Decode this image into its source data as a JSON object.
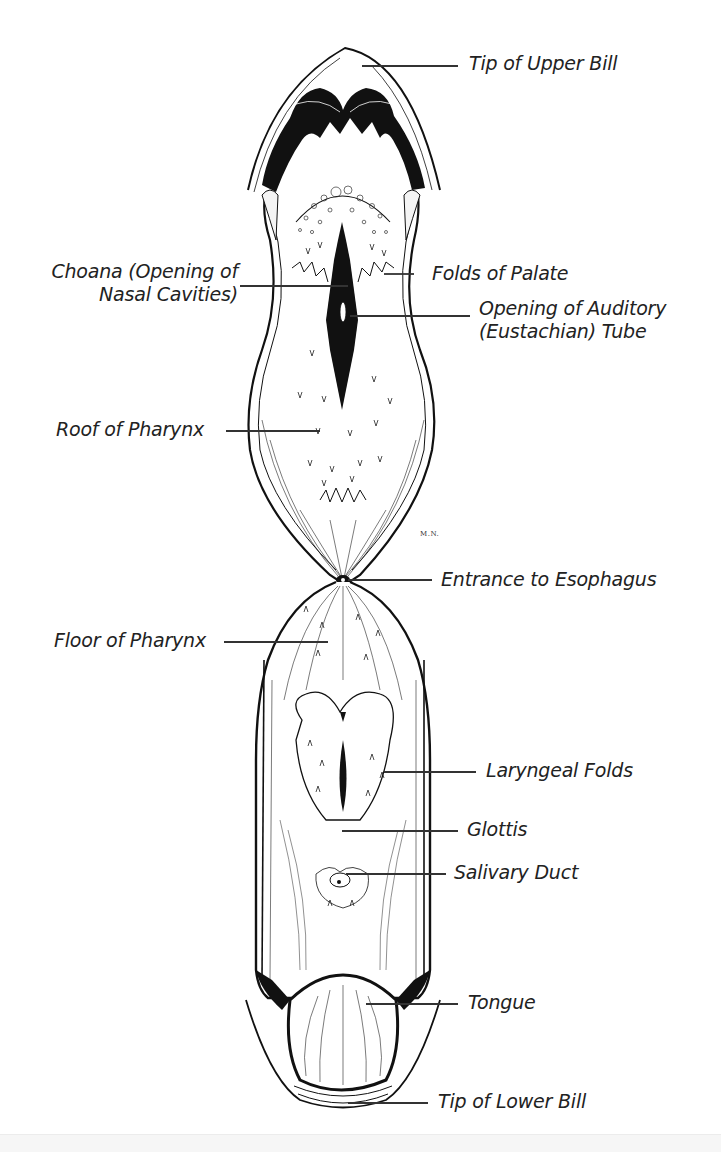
{
  "figure": {
    "artist_signature": "M.N.",
    "labels": {
      "tip_upper_bill": "Tip of Upper Bill",
      "choana_line1": "Choana (Opening of",
      "choana_line2": "Nasal Cavities)",
      "folds_of_palate": "Folds of Palate",
      "auditory_tube_line1": "Opening of Auditory",
      "auditory_tube_line2": "(Eustachian) Tube",
      "roof_of_pharynx": "Roof of  Pharynx",
      "entrance_esophagus": "Entrance to Esophagus",
      "floor_of_pharynx": "Floor of Pharynx",
      "laryngeal_folds": "Laryngeal Folds",
      "glottis": "Glottis",
      "salivary_duct": "Salivary Duct",
      "tongue": "Tongue",
      "tip_lower_bill": "Tip of Lower Bill"
    },
    "colors": {
      "ink": "#111111",
      "label_text": "#222222",
      "leader_line": "#333333",
      "background": "#ffffff"
    }
  }
}
